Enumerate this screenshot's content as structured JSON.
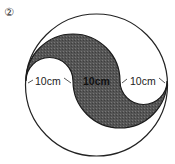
{
  "problem": {
    "number_label": "②"
  },
  "figure": {
    "outer_circle": {
      "cx": 96.5,
      "cy": 85,
      "r": 71
    },
    "diameter_y": 81,
    "points_x": [
      26,
      73,
      120,
      167
    ],
    "shade_color": "#5a5a5a",
    "stroke_color": "#222222",
    "segments": [
      {
        "label": "10cm"
      },
      {
        "label": "10cm"
      },
      {
        "label": "10cm"
      }
    ]
  }
}
